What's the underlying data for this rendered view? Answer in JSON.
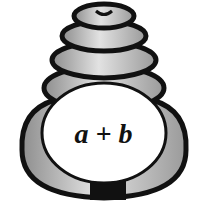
{
  "figure": {
    "label": "a + b"
  },
  "colors": {
    "stone": "#b8b8b8",
    "stone_light": "#dcdcdc",
    "outline": "#111111",
    "core": "#ffffff"
  }
}
